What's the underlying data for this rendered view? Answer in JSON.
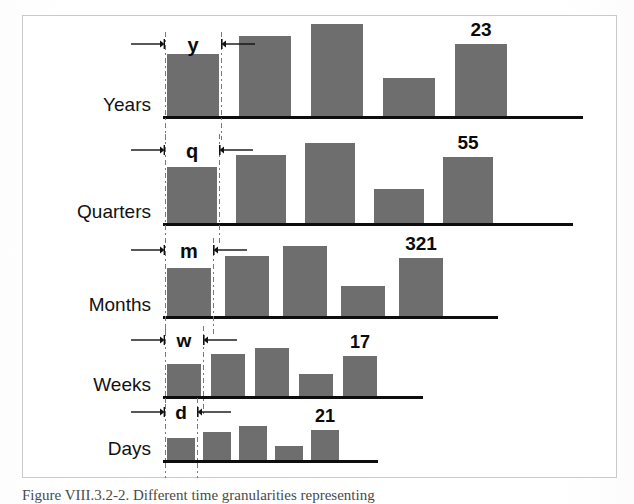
{
  "figure": {
    "caption": "Figure VIII.3.2-2. Different time granularities representing",
    "frame": {
      "border_color": "#c9c9c9",
      "background": "#ffffff"
    },
    "bar_color": "#6e6e6e",
    "baseline_color": "#0d0d0d",
    "guide_color": "#7a7a7a"
  },
  "chart_data": {
    "type": "bar",
    "title": "",
    "subtitle": "",
    "xlabel": "",
    "ylabel": "",
    "grid": false,
    "legend": "none",
    "rows": [
      {
        "name": "Years",
        "unit_letter": "y",
        "value_label": "23",
        "categories": [
          "1",
          "2",
          "3",
          "4",
          "5"
        ],
        "values": [
          62,
          80,
          92,
          38,
          72
        ]
      },
      {
        "name": "Quarters",
        "unit_letter": "q",
        "value_label": "55",
        "categories": [
          "1",
          "2",
          "3",
          "4",
          "5"
        ],
        "values": [
          56,
          68,
          80,
          34,
          66
        ]
      },
      {
        "name": "Months",
        "unit_letter": "m",
        "value_label": "321",
        "categories": [
          "1",
          "2",
          "3",
          "4",
          "5"
        ],
        "values": [
          48,
          60,
          70,
          30,
          58
        ]
      },
      {
        "name": "Weeks",
        "unit_letter": "w",
        "value_label": "17",
        "categories": [
          "1",
          "2",
          "3",
          "4",
          "5"
        ],
        "values": [
          32,
          42,
          48,
          22,
          40
        ]
      },
      {
        "name": "Days",
        "unit_letter": "d",
        "value_label": "21",
        "categories": [
          "1",
          "2",
          "3",
          "4",
          "5"
        ],
        "values": [
          22,
          28,
          34,
          14,
          30
        ]
      }
    ]
  },
  "icons": {
    "arrow_right": "arrow-right-tick-icon",
    "arrow_left": "arrow-left-tick-icon"
  }
}
